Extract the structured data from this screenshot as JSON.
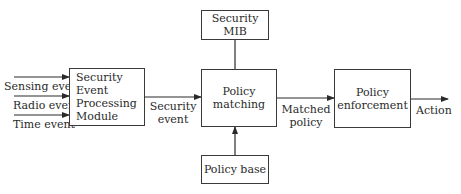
{
  "diagram": {
    "nodes": {
      "sep_module": {
        "lines": [
          "Security",
          "Event",
          "Processing",
          "Module"
        ]
      },
      "security_mib": {
        "label": "Security MIB"
      },
      "policy_matching": {
        "lines": [
          "Policy",
          "matching"
        ]
      },
      "policy_base": {
        "label": "Policy base"
      },
      "policy_enforcement": {
        "lines": [
          "Policy",
          "enforcement"
        ]
      }
    },
    "inputs": [
      {
        "label": "Sensing event"
      },
      {
        "label": "Radio event"
      },
      {
        "label": "Time event"
      }
    ],
    "edges": {
      "security_event": {
        "lines": [
          "Security",
          "event"
        ]
      },
      "matched_policy": {
        "lines": [
          "Matched",
          "policy"
        ]
      },
      "action": {
        "label": "Action"
      }
    },
    "colors": {
      "line": "#2a2a2a",
      "background": "#ffffff"
    }
  }
}
